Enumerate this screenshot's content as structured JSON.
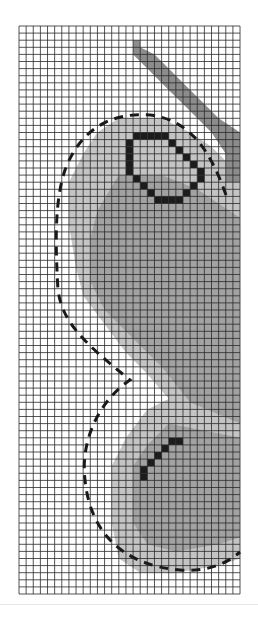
{
  "figure": {
    "type": "grid-occupancy-map",
    "grid": {
      "columns": 31,
      "rows": 80,
      "origin_px": [
        19,
        26
      ],
      "cell_w": 7.13,
      "cell_h": 7.1,
      "line_color": "#2a2a2a",
      "background": "#ffffff"
    },
    "colors": {
      "light_region": "#c4c4c4",
      "medium_region": "#a2a2a2",
      "stripe": "#8c8c8c",
      "dark_cells": "#1c1c1c",
      "dashed_curve": "#1a1a1a"
    },
    "regions": {
      "stripe": [
        [
          16,
          2
        ],
        [
          17,
          2
        ],
        [
          17,
          3
        ],
        [
          19,
          4
        ],
        [
          20,
          5
        ],
        [
          22,
          7
        ],
        [
          24,
          9
        ],
        [
          26,
          11
        ],
        [
          28,
          13
        ],
        [
          31,
          15
        ],
        [
          31,
          22
        ],
        [
          29,
          22
        ],
        [
          29,
          18
        ],
        [
          27,
          15
        ],
        [
          25,
          13
        ],
        [
          23,
          11
        ],
        [
          21,
          9
        ],
        [
          19,
          7
        ],
        [
          18,
          6
        ],
        [
          16,
          4
        ]
      ],
      "light_upper": [
        [
          14,
          13
        ],
        [
          20,
          13
        ],
        [
          24,
          15
        ],
        [
          27,
          17
        ],
        [
          29,
          19
        ],
        [
          31,
          21
        ],
        [
          31,
          58
        ],
        [
          24,
          56
        ],
        [
          18,
          49
        ],
        [
          15,
          46
        ],
        [
          12,
          42
        ],
        [
          9,
          38
        ],
        [
          8,
          34
        ],
        [
          7,
          28
        ],
        [
          7,
          22
        ],
        [
          9,
          18
        ],
        [
          11,
          15
        ]
      ],
      "medium_upper": [
        [
          14,
          21
        ],
        [
          20,
          21
        ],
        [
          25,
          23
        ],
        [
          28,
          25
        ],
        [
          31,
          27
        ],
        [
          31,
          56
        ],
        [
          24,
          53
        ],
        [
          20,
          48
        ],
        [
          16,
          44
        ],
        [
          12,
          40
        ],
        [
          10,
          36
        ],
        [
          10,
          30
        ],
        [
          11,
          26
        ]
      ],
      "light_lower": [
        [
          22,
          52
        ],
        [
          31,
          56
        ],
        [
          31,
          75
        ],
        [
          28,
          76
        ],
        [
          22,
          77
        ],
        [
          17,
          77
        ],
        [
          14,
          75
        ],
        [
          13,
          70
        ],
        [
          13,
          62
        ],
        [
          15,
          58
        ],
        [
          18,
          54
        ]
      ],
      "medium_lower": [
        [
          21,
          56
        ],
        [
          31,
          58
        ],
        [
          31,
          72
        ],
        [
          28,
          73
        ],
        [
          22,
          74
        ],
        [
          18,
          73
        ],
        [
          16,
          70
        ],
        [
          16,
          62
        ],
        [
          18,
          59
        ]
      ]
    },
    "dark_cells": {
      "octagon": [
        [
          16,
          15
        ],
        [
          17,
          15
        ],
        [
          18,
          15
        ],
        [
          19,
          15
        ],
        [
          20,
          15
        ],
        [
          21,
          16
        ],
        [
          22,
          17
        ],
        [
          23,
          18
        ],
        [
          24,
          19
        ],
        [
          25,
          20
        ],
        [
          25,
          21
        ],
        [
          24,
          22
        ],
        [
          23,
          23
        ],
        [
          22,
          24
        ],
        [
          21,
          24
        ],
        [
          20,
          24
        ],
        [
          19,
          24
        ],
        [
          18,
          23
        ],
        [
          17,
          22
        ],
        [
          16,
          21
        ],
        [
          15,
          20
        ],
        [
          15,
          19
        ],
        [
          15,
          18
        ],
        [
          15,
          17
        ],
        [
          15,
          16
        ]
      ],
      "diagonal": [
        [
          21,
          58
        ],
        [
          22,
          58
        ],
        [
          20,
          59
        ],
        [
          19,
          60
        ],
        [
          18,
          61
        ],
        [
          17,
          62
        ],
        [
          17,
          63
        ]
      ]
    },
    "dashed_curve_px": "M 226 195 C 210 150, 190 120, 150 115 C 110 112, 80 130, 65 170 C 55 200, 55 240, 58 290 C 62 320, 80 340, 130 380 C 100 400, 80 440, 85 480 C 90 530, 120 565, 180 570 C 205 572, 225 565, 240 552"
  }
}
